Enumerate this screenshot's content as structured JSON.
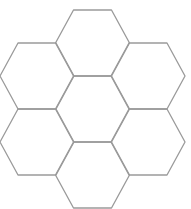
{
  "diagram": {
    "type": "hexagon-cluster",
    "stroke_color": "#9a9a9a",
    "background": "#ffffff",
    "hexagons": [
      {
        "name": "top",
        "cx": 92.5,
        "cy": 43
      },
      {
        "name": "upper-left",
        "cx": 37,
        "cy": 76
      },
      {
        "name": "upper-right",
        "cx": 148,
        "cy": 76
      },
      {
        "name": "center",
        "cx": 92.5,
        "cy": 109
      },
      {
        "name": "lower-left",
        "cx": 37,
        "cy": 142
      },
      {
        "name": "lower-right",
        "cx": 148,
        "cy": 142
      },
      {
        "name": "bottom",
        "cx": 92.5,
        "cy": 175
      }
    ],
    "hex_half_width": 37,
    "hex_half_top": 19,
    "hex_half_height": 33
  }
}
